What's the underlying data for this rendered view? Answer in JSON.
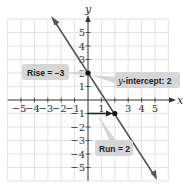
{
  "graph": {
    "x_axis_label": "x",
    "y_axis_label": "y",
    "x_ticks": [
      {
        "label": "−5",
        "value": -5
      },
      {
        "label": "−4",
        "value": -4
      },
      {
        "label": "−3",
        "value": -3
      },
      {
        "label": "−2",
        "value": -2
      },
      {
        "label": "−1",
        "value": -1
      },
      {
        "label": "1",
        "value": 1
      },
      {
        "label": "3",
        "value": 3
      },
      {
        "label": "4",
        "value": 4
      },
      {
        "label": "5",
        "value": 5
      }
    ],
    "y_ticks": [
      {
        "label": "5",
        "value": 5
      },
      {
        "label": "4",
        "value": 4
      },
      {
        "label": "3",
        "value": 3
      },
      {
        "label": "2",
        "value": 2
      },
      {
        "label": "1",
        "value": 1
      },
      {
        "label": "−1",
        "value": -1
      },
      {
        "label": "−2",
        "value": -2
      },
      {
        "label": "−3",
        "value": -3
      },
      {
        "label": "−4",
        "value": -4
      },
      {
        "label": "−5",
        "value": -5
      }
    ],
    "line": {
      "slope": -1.5,
      "intercept": 2,
      "color": "#555555"
    },
    "points": [
      {
        "x": 0,
        "y": 2
      },
      {
        "x": 2,
        "y": -1
      }
    ],
    "callouts": {
      "rise": {
        "prefix": "Rise = ",
        "value": "−3"
      },
      "y_intercept": {
        "prefix": "y",
        "suffix": "-intercept: 2"
      },
      "run": {
        "prefix": "Run = ",
        "value": "2"
      }
    },
    "colors": {
      "grid": "#d9d9d9",
      "axis": "#333333",
      "line": "#555555",
      "callout_bg": "#d6d6d6",
      "run_arrow": "#222222"
    }
  }
}
